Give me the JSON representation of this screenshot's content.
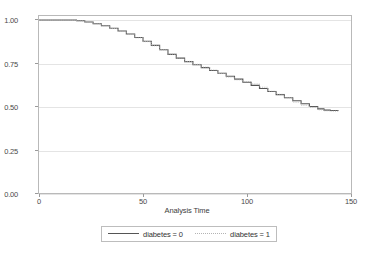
{
  "chart_data": {
    "type": "line",
    "title": "",
    "xlabel": "Analysis Time",
    "ylabel": "",
    "xlim": [
      0,
      150
    ],
    "ylim": [
      0,
      1.0
    ],
    "grid": true,
    "legend_position": "bottom",
    "x_ticks": [
      "0",
      "50",
      "100",
      "150"
    ],
    "x_tick_values": [
      0,
      50,
      100,
      150
    ],
    "y_ticks": [
      "0.00",
      "0.25",
      "0.50",
      "0.75",
      "1.00"
    ],
    "y_tick_values": [
      0.0,
      0.25,
      0.5,
      0.75,
      1.0
    ],
    "series": [
      {
        "name": "diabetes = 0",
        "color": "#555555",
        "style": "solid",
        "x": [
          0,
          5,
          10,
          14,
          18,
          22,
          26,
          30,
          34,
          38,
          42,
          46,
          50,
          54,
          58,
          62,
          66,
          70,
          74,
          78,
          82,
          86,
          90,
          94,
          98,
          102,
          106,
          110,
          114,
          118,
          122,
          126,
          130,
          134,
          137,
          140,
          144
        ],
        "values": [
          1.0,
          1.0,
          1.0,
          1.0,
          0.995,
          0.988,
          0.978,
          0.966,
          0.952,
          0.936,
          0.918,
          0.898,
          0.876,
          0.852,
          0.827,
          0.8,
          0.778,
          0.758,
          0.74,
          0.723,
          0.706,
          0.69,
          0.673,
          0.656,
          0.638,
          0.62,
          0.602,
          0.584,
          0.566,
          0.548,
          0.53,
          0.513,
          0.497,
          0.483,
          0.476,
          0.474,
          0.474
        ]
      },
      {
        "name": "diabetes = 1",
        "color": "#b4b4b4",
        "style": "dotted",
        "x": [
          0,
          5,
          10,
          14,
          18,
          22,
          26,
          30,
          34,
          38,
          42,
          46,
          50,
          54,
          58,
          62,
          66,
          70,
          74,
          78,
          82,
          86,
          90,
          94,
          98,
          102,
          106,
          110,
          114,
          118,
          122,
          126,
          130,
          134,
          137,
          140,
          144
        ],
        "values": [
          1.0,
          1.0,
          1.0,
          1.0,
          0.994,
          0.987,
          0.977,
          0.965,
          0.95,
          0.934,
          0.916,
          0.896,
          0.874,
          0.85,
          0.826,
          0.801,
          0.779,
          0.759,
          0.742,
          0.726,
          0.709,
          0.69,
          0.668,
          0.652,
          0.642,
          0.628,
          0.609,
          0.586,
          0.568,
          0.547,
          0.522,
          0.504,
          0.492,
          0.478,
          0.472,
          0.47,
          0.47
        ]
      }
    ]
  },
  "axis": {
    "x_title": "Analysis Time"
  },
  "legend": {
    "entries": [
      {
        "label": "diabetes = 0"
      },
      {
        "label": "diabetes = 1"
      }
    ]
  }
}
